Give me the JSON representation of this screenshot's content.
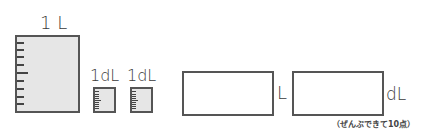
{
  "figure": {
    "large_container": {
      "label": "1 L",
      "tick_count": 9,
      "fill_color": "#e6e6e6"
    },
    "small_containers": [
      {
        "label": "1dL",
        "tick_count": 9,
        "fill_color": "#e6e6e6"
      },
      {
        "label": "1dL",
        "tick_count": 9,
        "fill_color": "#e6e6e6"
      }
    ]
  },
  "answer": {
    "box1": {
      "value": "",
      "unit": "L"
    },
    "box2": {
      "value": "",
      "unit": "dL"
    }
  },
  "note": "（ぜんぶできて10点）"
}
